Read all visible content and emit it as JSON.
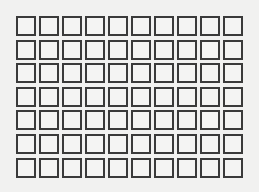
{
  "document": {
    "type": "blank-box-grid",
    "rows": 7,
    "columns": 10,
    "cell_border_color": "#3a3a3a",
    "background_color": "#f1f1f0",
    "cells": [
      [
        "",
        "",
        "",
        "",
        "",
        "",
        "",
        "",
        "",
        ""
      ],
      [
        "",
        "",
        "",
        "",
        "",
        "",
        "",
        "",
        "",
        ""
      ],
      [
        "",
        "",
        "",
        "",
        "",
        "",
        "",
        "",
        "",
        ""
      ],
      [
        "",
        "",
        "",
        "",
        "",
        "",
        "",
        "",
        "",
        ""
      ],
      [
        "",
        "",
        "",
        "",
        "",
        "",
        "",
        "",
        "",
        ""
      ],
      [
        "",
        "",
        "",
        "",
        "",
        "",
        "",
        "",
        "",
        ""
      ],
      [
        "",
        "",
        "",
        "",
        "",
        "",
        "",
        "",
        "",
        ""
      ]
    ]
  }
}
